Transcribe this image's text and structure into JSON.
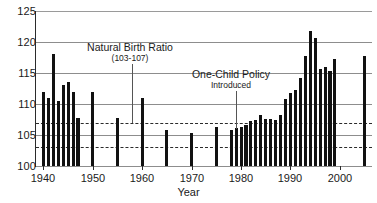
{
  "chart_data": {
    "type": "bar",
    "title": "",
    "xlabel": "Year",
    "ylabel": "",
    "ylim": [
      100,
      125
    ],
    "xlim": [
      1938.5,
      2006.5
    ],
    "grid": true,
    "legend_position": "none",
    "ytick_labels": [
      "100",
      "105",
      "110",
      "115",
      "120",
      "125"
    ],
    "yticks": [
      100,
      105,
      110,
      115,
      120,
      125
    ],
    "xtick_labels": [
      "1940",
      "1950",
      "1960",
      "1970",
      "1980",
      "1990",
      "2000"
    ],
    "xticks": [
      1940,
      1950,
      1960,
      1970,
      1980,
      1990,
      2000
    ],
    "reference_lines": [
      {
        "value": 107,
        "style": "dashed",
        "label": "107"
      },
      {
        "value": 103,
        "style": "dashed",
        "label": "103"
      }
    ],
    "annotations": [
      {
        "id": "natural-birth-ratio",
        "main": "Natural Birth Ratio",
        "sub": "(103-107)",
        "points_to_year": 1958,
        "points_to_value": 107
      },
      {
        "id": "one-child-policy",
        "main": "One-Child Policy",
        "sub": "Introduced",
        "points_to_year": 1979,
        "points_to_value": 106
      }
    ],
    "categories": [
      1940,
      1941,
      1942,
      1943,
      1944,
      1945,
      1946,
      1947,
      1950,
      1955,
      1960,
      1965,
      1970,
      1975,
      1978,
      1979,
      1980,
      1981,
      1982,
      1983,
      1984,
      1985,
      1986,
      1987,
      1988,
      1989,
      1990,
      1991,
      1992,
      1993,
      1994,
      1995,
      1996,
      1997,
      1998,
      1999,
      2005
    ],
    "values": [
      112.0,
      111.0,
      118.0,
      110.5,
      113.0,
      113.5,
      112.0,
      107.8,
      112.0,
      107.8,
      111.0,
      105.8,
      105.3,
      106.3,
      105.8,
      106.1,
      106.3,
      106.6,
      107.2,
      107.5,
      108.2,
      107.6,
      107.6,
      107.4,
      108.2,
      110.8,
      111.8,
      112.2,
      114.2,
      117.8,
      121.8,
      120.6,
      115.7,
      115.9,
      115.4,
      117.2,
      117.8
    ],
    "bars": [
      {
        "year": 1940,
        "value": 112.0
      },
      {
        "year": 1941,
        "value": 111.0
      },
      {
        "year": 1942,
        "value": 118.0
      },
      {
        "year": 1943,
        "value": 110.5
      },
      {
        "year": 1944,
        "value": 113.0
      },
      {
        "year": 1945,
        "value": 113.5
      },
      {
        "year": 1946,
        "value": 112.0
      },
      {
        "year": 1947,
        "value": 107.8
      },
      {
        "year": 1950,
        "value": 112.0
      },
      {
        "year": 1955,
        "value": 107.8
      },
      {
        "year": 1960,
        "value": 111.0
      },
      {
        "year": 1965,
        "value": 105.8
      },
      {
        "year": 1970,
        "value": 105.3
      },
      {
        "year": 1975,
        "value": 106.3
      },
      {
        "year": 1978,
        "value": 105.8
      },
      {
        "year": 1979,
        "value": 106.1
      },
      {
        "year": 1980,
        "value": 106.3
      },
      {
        "year": 1981,
        "value": 106.6
      },
      {
        "year": 1982,
        "value": 107.2
      },
      {
        "year": 1983,
        "value": 107.5
      },
      {
        "year": 1984,
        "value": 108.2
      },
      {
        "year": 1985,
        "value": 107.6
      },
      {
        "year": 1986,
        "value": 107.6
      },
      {
        "year": 1987,
        "value": 107.4
      },
      {
        "year": 1988,
        "value": 108.2
      },
      {
        "year": 1989,
        "value": 110.8
      },
      {
        "year": 1990,
        "value": 111.8
      },
      {
        "year": 1991,
        "value": 112.2
      },
      {
        "year": 1992,
        "value": 114.2
      },
      {
        "year": 1993,
        "value": 117.8
      },
      {
        "year": 1994,
        "value": 121.8
      },
      {
        "year": 1995,
        "value": 120.6
      },
      {
        "year": 1996,
        "value": 115.7
      },
      {
        "year": 1997,
        "value": 115.9
      },
      {
        "year": 1998,
        "value": 115.4
      },
      {
        "year": 1999,
        "value": 117.2
      },
      {
        "year": 2005,
        "value": 117.8
      }
    ],
    "colors": {
      "bar": "#111111",
      "gridline": "#8d8d8d",
      "refline": "#2b2b2b",
      "axis": "#2b2b2b",
      "text": "#1a1a1a",
      "background": "#ffffff"
    }
  }
}
